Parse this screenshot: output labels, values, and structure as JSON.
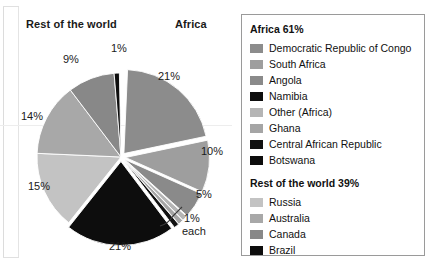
{
  "chart_data": {
    "type": "pie",
    "title": "",
    "headers": {
      "left": "Rest of the world",
      "right": "Africa"
    },
    "groups": [
      {
        "name": "Africa",
        "total_label": "Africa 61%",
        "total": 61,
        "items": [
          {
            "label": "Democratic Republic of Congo",
            "value": 21,
            "value_label": "21%",
            "color": "#8c8c8c"
          },
          {
            "label": "South Africa",
            "value": 10,
            "value_label": "10%",
            "color": "#9e9e9e"
          },
          {
            "label": "Angola",
            "value": 5,
            "value_label": "5%",
            "color": "#8a8a8a"
          },
          {
            "label": "Namibia",
            "value": 21,
            "value_label": "21%",
            "color": "#0d0d0d"
          },
          {
            "label": "Other (Africa)",
            "value": 1,
            "value_label": "1%",
            "color": "#b5b5b5"
          },
          {
            "label": "Ghana",
            "value": 1,
            "value_label": "1%",
            "color": "#a5a5a5"
          },
          {
            "label": "Central African Republic",
            "value": 1,
            "value_label": "1%",
            "color": "#111111"
          },
          {
            "label": "Botswana",
            "value": 1,
            "value_label": "1%",
            "color": "#0d0d0d"
          }
        ]
      },
      {
        "name": "Rest of the world",
        "total_label": "Rest of the world 39%",
        "total": 39,
        "items": [
          {
            "label": "Russia",
            "value": 15,
            "value_label": "15%",
            "color": "#c3c3c3"
          },
          {
            "label": "Australia",
            "value": 14,
            "value_label": "14%",
            "color": "#a8a8a8"
          },
          {
            "label": "Canada",
            "value": 9,
            "value_label": "9%",
            "color": "#888888"
          },
          {
            "label": "Brazil",
            "value": 1,
            "value_label": "1%",
            "color": "#0d0d0d"
          }
        ]
      }
    ],
    "callout": {
      "line1": "1%",
      "line2": "each"
    },
    "visible_slice_labels": [
      "21%",
      "10%",
      "5%",
      "21%",
      "15%",
      "14%",
      "9%",
      "1%"
    ],
    "legend_position": "right",
    "exploded": true,
    "grid": false
  }
}
